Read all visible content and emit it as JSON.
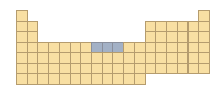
{
  "diagram": {
    "type": "periodic-table-outline",
    "columns": 18,
    "rows": 7,
    "colors": {
      "cell_fill": "#f8dfa3",
      "cell_border": "#b59c6e",
      "highlight_fill": "#a3b1c6"
    },
    "row_groups": [
      [
        1,
        18
      ],
      [
        1,
        2,
        13,
        14,
        15,
        16,
        17,
        18
      ],
      [
        1,
        2,
        13,
        14,
        15,
        16,
        17,
        18
      ],
      [
        1,
        2,
        3,
        4,
        5,
        6,
        7,
        8,
        9,
        10,
        11,
        12,
        13,
        14,
        15,
        16,
        17,
        18
      ],
      [
        1,
        2,
        3,
        4,
        5,
        6,
        7,
        8,
        9,
        10,
        11,
        12,
        13,
        14,
        15,
        16,
        17,
        18
      ],
      [
        1,
        2,
        3,
        4,
        5,
        6,
        7,
        8,
        9,
        10,
        11,
        12,
        13,
        14,
        15,
        16,
        17,
        18
      ],
      [
        1,
        2,
        3,
        4,
        5,
        6,
        7,
        8,
        9,
        10,
        11,
        12
      ]
    ],
    "highlighted": [
      {
        "period": 4,
        "group": 8
      },
      {
        "period": 4,
        "group": 9
      },
      {
        "period": 4,
        "group": 10
      }
    ]
  }
}
